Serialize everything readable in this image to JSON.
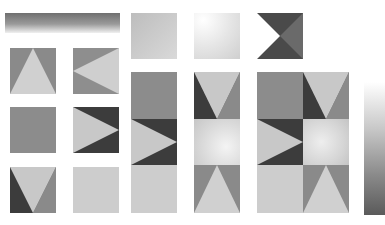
{
  "sheet": {
    "description": "UI skin sprite sheet",
    "colors": {
      "dark": "#3c3c3c",
      "mid": "#8a8a8a",
      "midlight": "#9a9a9a",
      "light": "#c9c9c9",
      "lighter": "#d6d6d6",
      "white": "#ffffff"
    },
    "pieces": [
      {
        "name": "header-gradient-bar"
      },
      {
        "name": "flat-light-tile"
      },
      {
        "name": "radial-light-tile"
      },
      {
        "name": "dark-notch-tile"
      },
      {
        "name": "arrow-up-tile"
      },
      {
        "name": "arrow-left-tile"
      },
      {
        "name": "flat-mid-tile"
      },
      {
        "name": "arrow-right-dark-tile"
      },
      {
        "name": "arrow-down-dark-tile"
      },
      {
        "name": "flat-lighter-tile"
      },
      {
        "name": "vertical-gradient-bar"
      }
    ]
  }
}
